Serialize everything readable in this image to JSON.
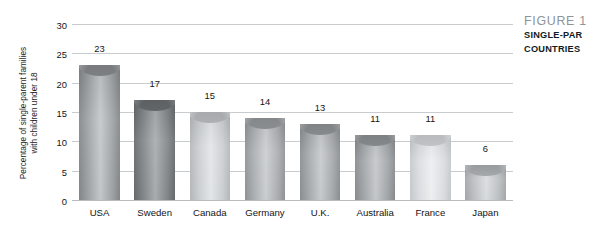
{
  "chart_data": {
    "type": "bar",
    "title": "",
    "xlabel": "",
    "ylabel": "Percentage of single-parent families with children under 18",
    "ylabel_lines": [
      "Percentage of single-parent families",
      "with children under 18"
    ],
    "categories": [
      "USA",
      "Sweden",
      "Canada",
      "Germany",
      "U.K.",
      "Australia",
      "France",
      "Japan"
    ],
    "values": [
      23,
      17,
      15,
      14,
      13,
      11,
      11,
      6
    ],
    "value_labels": [
      "23",
      "17",
      "15",
      "14",
      "13",
      "11",
      "11",
      "6"
    ],
    "ylim": [
      0,
      30
    ],
    "ytick_values": [
      0,
      5,
      10,
      15,
      20,
      25,
      30
    ],
    "ytick_labels": [
      "0",
      "5",
      "10",
      "15",
      "20",
      "25",
      "30"
    ],
    "grid": true,
    "grid_axis": "y",
    "legend": "none",
    "bar_colors": [
      "#9b9fa1",
      "#7e8285",
      "#cacdcf",
      "#a8acae",
      "#a2a6a8",
      "#9fa3a5",
      "#d9dcde",
      "#babec0"
    ],
    "bar_colors_light": [
      "#c2c6c8",
      "#a6aaac",
      "#e2e5e6",
      "#cacdcf",
      "#c6c9cb",
      "#c3c6c8",
      "#eceeef",
      "#d8dbdc"
    ],
    "bar_colors_dark": [
      "#7f8386",
      "#626669",
      "#b2b5b7",
      "#8c9093",
      "#878b8e",
      "#84888b",
      "#c4c7c9",
      "#a0a4a6"
    ],
    "gridline_color": "#c9ccce",
    "axis_color": "#b9bdbf"
  },
  "caption": {
    "figure_line": "FIGURE 1",
    "line1": "SINGLE-PAR",
    "line2": "COUNTRIES",
    "figure_color": "#8e9498",
    "text_color": "#111b26"
  }
}
